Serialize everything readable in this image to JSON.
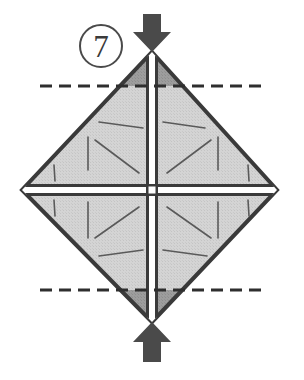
{
  "figure": {
    "step_label": "7",
    "step_badge_name": "circled-step-number",
    "colors": {
      "paper_fill": "#d2d2d2",
      "paper_fill_dark": "#9a9a9a",
      "outline": "#3a3a3a",
      "crease_line": "#4a4a4a",
      "arrow_fill": "#4a4a4a",
      "dashed_line": "#2e2e2e",
      "background": "#ffffff",
      "highlight": "#ffffff"
    },
    "geometry": {
      "top_vertex": [
        152,
        52
      ],
      "right_vertex": [
        277,
        190
      ],
      "bottom_vertex": [
        152,
        322
      ],
      "left_vertex": [
        22,
        190
      ],
      "center": [
        152,
        190
      ]
    },
    "dashed_lines": [
      {
        "name": "upper-fold-line",
        "y": 86,
        "x_start": 40,
        "x_end": 262,
        "label": "valley fold line (upper)"
      },
      {
        "name": "lower-fold-line",
        "y": 290,
        "x_start": 40,
        "x_end": 262,
        "label": "valley fold line (lower)"
      }
    ],
    "arrows": [
      {
        "name": "top-fold-arrow",
        "direction": "down",
        "x": 152,
        "y_tip": 52,
        "label": "fold top corner down/back"
      },
      {
        "name": "bottom-fold-arrow",
        "direction": "up",
        "x": 152,
        "y_tip": 322,
        "label": "fold bottom corner up/back"
      }
    ],
    "creases": [
      {
        "name": "vertical-crease",
        "from": [
          152,
          52
        ],
        "to": [
          152,
          322
        ]
      },
      {
        "name": "horizontal-crease",
        "from": [
          22,
          190
        ],
        "to": [
          277,
          190
        ]
      }
    ],
    "quadrants": [
      {
        "name": "quadrant-upper-left"
      },
      {
        "name": "quadrant-upper-right"
      },
      {
        "name": "quadrant-lower-left"
      },
      {
        "name": "quadrant-lower-right"
      }
    ],
    "texture_strokes": {
      "upper_left": [
        [
          143,
          128,
          99,
          122
        ],
        [
          95,
          140,
          139,
          173
        ],
        [
          88,
          137,
          88,
          170
        ],
        [
          54,
          165,
          56,
          180
        ]
      ],
      "upper_right": [
        [
          163,
          122,
          205,
          128
        ],
        [
          167,
          173,
          211,
          140
        ],
        [
          218,
          137,
          218,
          170
        ],
        [
          248,
          165,
          248,
          180
        ]
      ],
      "lower_left": [
        [
          54,
          200,
          56,
          215
        ],
        [
          88,
          202,
          88,
          238
        ],
        [
          95,
          238,
          139,
          207
        ],
        [
          99,
          256,
          143,
          250
        ]
      ],
      "lower_right": [
        [
          167,
          207,
          211,
          238
        ],
        [
          218,
          202,
          218,
          238
        ],
        [
          248,
          200,
          248,
          215
        ],
        [
          163,
          250,
          207,
          256
        ]
      ]
    }
  }
}
